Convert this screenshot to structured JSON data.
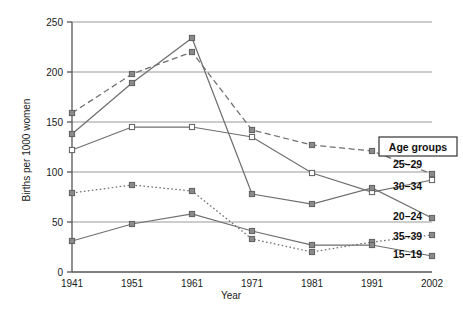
{
  "chart_data": {
    "type": "line",
    "title": "",
    "xlabel": "Year",
    "ylabel": "Births per 1000 women",
    "categories": [
      "1941",
      "1951",
      "1961",
      "1971",
      "1981",
      "1991",
      "2002"
    ],
    "x": [
      1941,
      1951,
      1961,
      1971,
      1981,
      1991,
      2002
    ],
    "ylim": [
      0,
      250
    ],
    "yticks": [
      0,
      50,
      100,
      150,
      200,
      250
    ],
    "ytick_labels": [
      "0",
      "50",
      "100",
      "150",
      "200",
      "250"
    ],
    "grid": "horizontal",
    "legend_position": "right",
    "legend_title": "Age groups",
    "series": [
      {
        "name": "25–29",
        "values": [
          159,
          198,
          220,
          142,
          127,
          121,
          98
        ],
        "line_style": "dashed",
        "marker": "square-filled",
        "color": "#6f6f6f",
        "label_value": 108
      },
      {
        "name": "30–34",
        "values": [
          122,
          145,
          145,
          135,
          99,
          80,
          92
        ],
        "line_style": "solid",
        "marker": "square-open",
        "color": "#6f6f6f",
        "label_value": 86
      },
      {
        "name": "20–24",
        "values": [
          138,
          189,
          234,
          78,
          68,
          84,
          54
        ],
        "line_style": "solid",
        "marker": "square-filled",
        "color": "#6f6f6f",
        "label_value": 56
      },
      {
        "name": "35–39",
        "values": [
          79,
          87,
          81,
          33,
          20,
          30,
          37
        ],
        "line_style": "dotted",
        "marker": "square-filled",
        "color": "#6f6f6f",
        "label_value": 36
      },
      {
        "name": "15–19",
        "values": [
          31,
          48,
          58,
          41,
          27,
          27,
          16
        ],
        "line_style": "solid",
        "marker": "square-filled",
        "color": "#6f6f6f",
        "label_value": 18
      }
    ]
  },
  "axes": {
    "y_axis_title": "Births per 1000 women",
    "x_axis_title": "Year"
  },
  "legend": {
    "box_label": "Age groups",
    "entries": [
      "25–29",
      "30–34",
      "20–24",
      "35–39",
      "15–19"
    ]
  },
  "style": {
    "grid_color": "#9a9a9a",
    "axis_color": "#555555",
    "series_color": "#6f6f6f",
    "text_color": "#1a1a1a",
    "background": "#ffffff"
  }
}
